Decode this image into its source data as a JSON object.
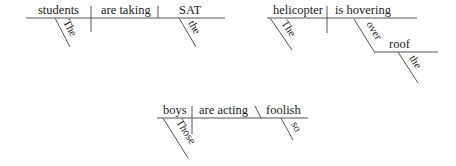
{
  "diagrams": [
    {
      "sentence": 1,
      "subject": "students",
      "verb": "are taking",
      "object": "SAT",
      "modifiers": {
        "subject": "The",
        "object": "the"
      }
    },
    {
      "sentence": 2,
      "subject": "helicopter",
      "verb": "is hovering",
      "modifiers": {
        "subject": "The",
        "preposition": "over",
        "prep_object": "roof",
        "prep_object_modifier": "the"
      }
    },
    {
      "sentence": 3,
      "subject": "boys",
      "verb": "are acting",
      "complement": "foolish",
      "modifiers": {
        "subject": "Those",
        "complement": "so"
      }
    }
  ],
  "colors": {
    "line": "#555555",
    "text": "#222222",
    "background": "#ffffff"
  }
}
